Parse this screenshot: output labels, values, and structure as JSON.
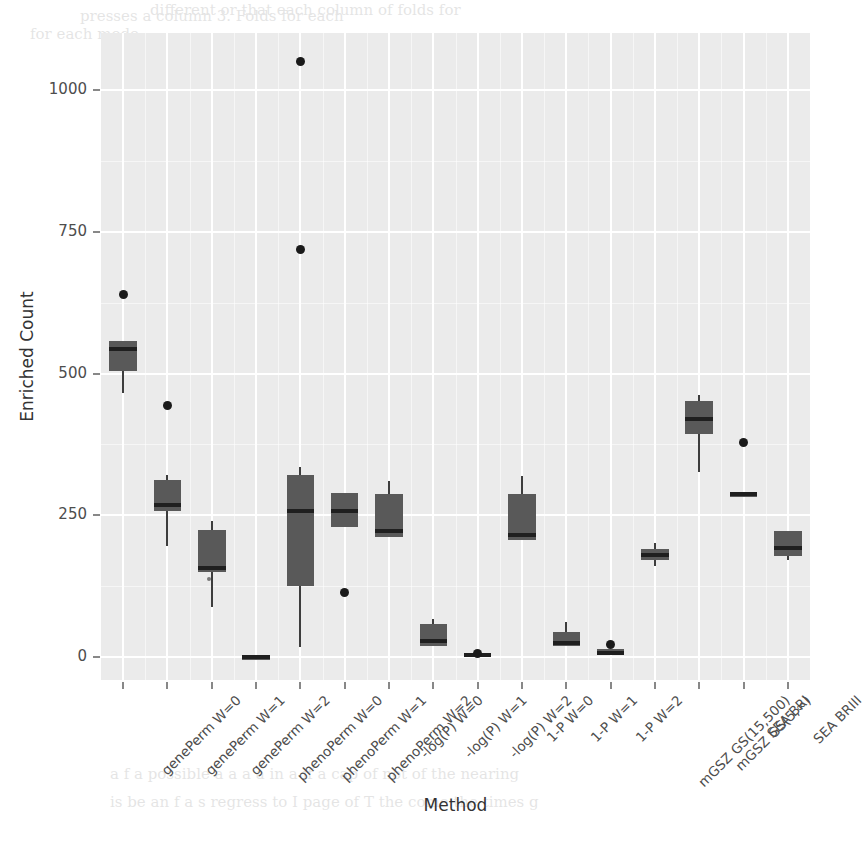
{
  "chart_data": {
    "type": "box",
    "title": "",
    "xlabel": "Method",
    "ylabel": "Enriched Count",
    "ylim": [
      -40,
      1100
    ],
    "yticks": [
      0,
      250,
      500,
      750,
      1000
    ],
    "ytick_labels": [
      "0",
      "250",
      "500",
      "750",
      "1000"
    ],
    "grid": true,
    "legend": "none",
    "panel_color": "#ebebeb",
    "box_fill": "#595959",
    "median_color": "#1f1f1f",
    "outlier_color": "#1a1a1a",
    "categories": [
      "genePerm W=0",
      "genePerm W=1",
      "genePerm W=2",
      "phenoPerm W=0",
      "phenoPerm W=1",
      "phenoPerm W=2",
      "-log(P) W=0",
      "-log(P) W=1",
      "-log(P) W=2",
      "1-P W=0",
      "1-P W=1",
      "1-P W=2",
      "mGSZ GS(15,500)",
      "mGSZ GS(5,∞)",
      "SEA BRI",
      "SEA BRIII"
    ],
    "boxes": [
      {
        "category": "genePerm W=0",
        "q1": 504,
        "median": 543,
        "q3": 558,
        "whisker_low": 466,
        "whisker_high": 558,
        "outliers": [
          640
        ]
      },
      {
        "category": "genePerm W=1",
        "q1": 258,
        "median": 268,
        "q3": 312,
        "whisker_low": 196,
        "whisker_high": 322,
        "outliers": [
          443
        ]
      },
      {
        "category": "genePerm W=2",
        "q1": 150,
        "median": 158,
        "q3": 224,
        "whisker_low": 88,
        "whisker_high": 240,
        "outliers": [
          133
        ]
      },
      {
        "category": "phenoPerm W=0",
        "q1": 0,
        "median": 0,
        "q3": 0,
        "whisker_low": 0,
        "whisker_high": 0,
        "outliers": []
      },
      {
        "category": "phenoPerm W=1",
        "q1": 126,
        "median": 258,
        "q3": 322,
        "whisker_low": 18,
        "whisker_high": 336,
        "outliers": [
          718,
          1050
        ]
      },
      {
        "category": "phenoPerm W=2",
        "q1": 230,
        "median": 258,
        "q3": 290,
        "whisker_low": 230,
        "whisker_high": 290,
        "outliers": [
          115
        ]
      },
      {
        "category": "-log(P) W=0",
        "q1": 212,
        "median": 222,
        "q3": 288,
        "whisker_low": 212,
        "whisker_high": 310,
        "outliers": []
      },
      {
        "category": "-log(P) W=1",
        "q1": 20,
        "median": 28,
        "q3": 58,
        "whisker_low": 20,
        "whisker_high": 68,
        "outliers": []
      },
      {
        "category": "-log(P) W=2",
        "q1": 2,
        "median": 4,
        "q3": 8,
        "whisker_low": 2,
        "whisker_high": 8,
        "outliers": [
          6
        ]
      },
      {
        "category": "1-P W=0",
        "q1": 206,
        "median": 216,
        "q3": 288,
        "whisker_low": 206,
        "whisker_high": 320,
        "outliers": []
      },
      {
        "category": "1-P W=1",
        "q1": 20,
        "median": 26,
        "q3": 44,
        "whisker_low": 20,
        "whisker_high": 62,
        "outliers": []
      },
      {
        "category": "1-P W=2",
        "q1": 4,
        "median": 8,
        "q3": 14,
        "whisker_low": 4,
        "whisker_high": 14,
        "outliers": [
          22
        ]
      },
      {
        "category": "mGSZ GS(15,500)",
        "q1": 172,
        "median": 180,
        "q3": 190,
        "whisker_low": 160,
        "whisker_high": 202,
        "outliers": []
      },
      {
        "category": "mGSZ GS(5,∞)",
        "q1": 394,
        "median": 420,
        "q3": 452,
        "whisker_low": 326,
        "whisker_high": 462,
        "outliers": []
      },
      {
        "category": "SEA BRI",
        "q1": 283,
        "median": 287,
        "q3": 291,
        "whisker_low": 283,
        "whisker_high": 291,
        "outliers": [
          378
        ]
      },
      {
        "category": "SEA BRIII",
        "q1": 178,
        "median": 192,
        "q3": 222,
        "whisker_low": 172,
        "whisker_high": 222,
        "outliers": []
      }
    ]
  },
  "ghost_text": [
    {
      "t": "presses a column 3. Folds for each",
      "x": 80,
      "y": 4
    },
    {
      "t": "different or that each column of folds for",
      "x": 150,
      "y": -2
    },
    {
      "t": "for each mode",
      "x": 30,
      "y": 22
    },
    {
      "t": "3 | 0 ...... 3 4 ...... 5 6",
      "x": 330,
      "y": 116
    },
    {
      "t": "4 | 5 ...... 2 6 ...... 1 3",
      "x": 330,
      "y": 142
    },
    {
      "t": "| 0 0 ...... 2 5 ...... 4 8",
      "x": 330,
      "y": 168
    },
    {
      "t": "the to some line was are adding to a 1 for",
      "x": 180,
      "y": 246
    },
    {
      "t": "A R. For the  cases in  present  set  addition   cm",
      "x": 150,
      "y": 272
    },
    {
      "t": "present / on the set for all the works of   so  an  taking and copying",
      "x": 160,
      "y": 298
    },
    {
      "t": "testing",
      "x": 230,
      "y": 380
    },
    {
      "t": "own  All of  its",
      "x": 190,
      "y": 420
    },
    {
      "t": "more than the other respects. The",
      "x": 140,
      "y": 478
    },
    {
      "t": "did  the  use  can  some  of  a  number  of  that  of  for  I  sends",
      "x": 130,
      "y": 500
    },
    {
      "t": "so / calculate a table. Next, R is  for most  of  the  mentions  it",
      "x": 140,
      "y": 522
    },
    {
      "t": "of the something the",
      "x": 160,
      "y": 544
    },
    {
      "t": "a f  a  possible   a  a  a  a  in  a  if  a  cap  of  not  of  the  nearing",
      "x": 110,
      "y": 762
    },
    {
      "t": "is  be   an f a  s  regress  to  I  page  of  T  the  come  the  times  g",
      "x": 110,
      "y": 790
    }
  ]
}
